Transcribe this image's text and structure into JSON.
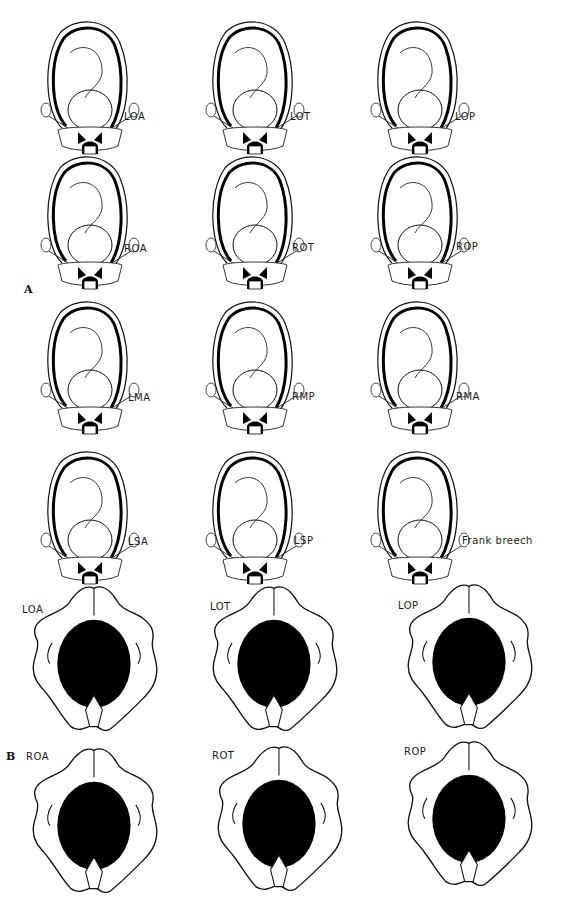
{
  "section_a": {
    "label": "A",
    "rows": [
      [
        {
          "label": "LOA"
        },
        {
          "label": "LOT"
        },
        {
          "label": "LOP"
        }
      ],
      [
        {
          "label": "ROA"
        },
        {
          "label": "ROT"
        },
        {
          "label": "ROP"
        }
      ],
      [
        {
          "label": "LMA"
        },
        {
          "label": "RMP"
        },
        {
          "label": "RMA"
        }
      ],
      [
        {
          "label": "LSA"
        },
        {
          "label": "LSP"
        },
        {
          "label": "Frank breech"
        }
      ]
    ]
  },
  "section_b": {
    "label": "B",
    "rows": [
      [
        {
          "label": "LOA"
        },
        {
          "label": "LOT"
        },
        {
          "label": "LOP"
        }
      ],
      [
        {
          "label": "ROA"
        },
        {
          "label": "ROT"
        },
        {
          "label": "ROP"
        }
      ]
    ]
  }
}
